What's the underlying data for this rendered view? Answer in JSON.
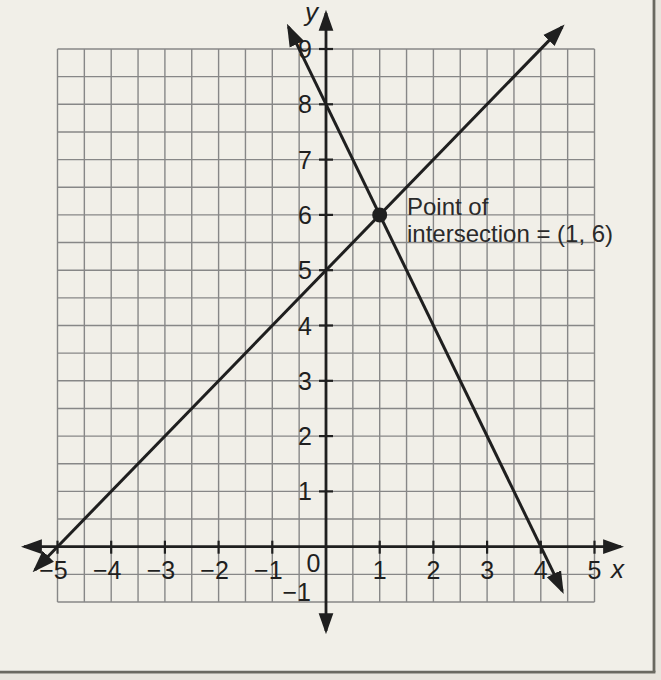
{
  "figure": {
    "paper_color": "#f1efe8",
    "outer_paper_color": "#e8e5dd",
    "frame_color": "#6a6960",
    "grid_color": "#878787",
    "ink_color": "#1f1f1f",
    "label_color": "#2a2a2a"
  },
  "chart_data": {
    "type": "line",
    "title": "",
    "xlabel": "x",
    "ylabel": "y",
    "xlim": [
      -5,
      5
    ],
    "ylim": [
      -1,
      9
    ],
    "grid": true,
    "grid_step": 0.5,
    "x_ticks": [
      -5,
      -4,
      -3,
      -2,
      -1,
      0,
      1,
      2,
      3,
      4,
      5
    ],
    "y_ticks": [
      -1,
      1,
      2,
      3,
      4,
      5,
      6,
      7,
      8,
      9
    ],
    "origin_label": "0",
    "series": [
      {
        "name": "rising-line",
        "equation": "y = x + 5",
        "slope": 1,
        "y_intercept": 5,
        "x_intercept": -5,
        "draw_from": [
          -5.42,
          -0.42
        ],
        "draw_to": [
          4.4,
          9.4
        ]
      },
      {
        "name": "falling-line",
        "equation": "y = -2x + 8",
        "slope": -2,
        "y_intercept": 8,
        "x_intercept": 4,
        "draw_from": [
          -0.7,
          9.4
        ],
        "draw_to": [
          4.4,
          -0.8
        ]
      }
    ],
    "intersection_point": [
      1,
      6
    ],
    "annotation": {
      "line1": "Point of",
      "line2": "intersection = (1, 6)"
    }
  }
}
